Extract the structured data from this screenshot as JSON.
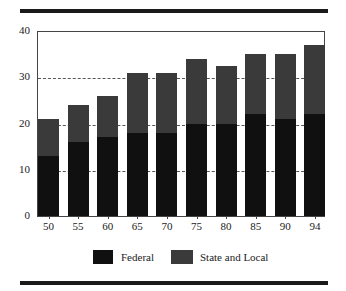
{
  "chart_data": {
    "type": "bar",
    "stacked": true,
    "title": "",
    "xlabel": "",
    "ylabel": "",
    "categories": [
      "50",
      "55",
      "60",
      "65",
      "70",
      "75",
      "80",
      "85",
      "90",
      "94"
    ],
    "series": [
      {
        "name": "Federal",
        "color": "#101010",
        "values": [
          13,
          16,
          17,
          18,
          18,
          20,
          20,
          22,
          21,
          22
        ]
      },
      {
        "name": "State and Local",
        "color": "#3a3a3a",
        "values": [
          8,
          8,
          9,
          13,
          13,
          14,
          12.5,
          13,
          14,
          15
        ]
      }
    ],
    "totals": [
      21,
      24,
      26,
      31,
      31,
      34,
      32.5,
      35,
      35,
      37
    ],
    "ylim": [
      0,
      40
    ],
    "yticks": [
      "0",
      "10",
      "20",
      "30",
      "40"
    ],
    "grid": {
      "y": true,
      "style": "dashed",
      "lines_at": [
        10,
        20,
        30
      ]
    },
    "legend": {
      "position": "bottom",
      "entries": [
        "Federal",
        "State and Local"
      ]
    }
  },
  "legend": {
    "federal": "Federal",
    "state": "State and Local"
  }
}
